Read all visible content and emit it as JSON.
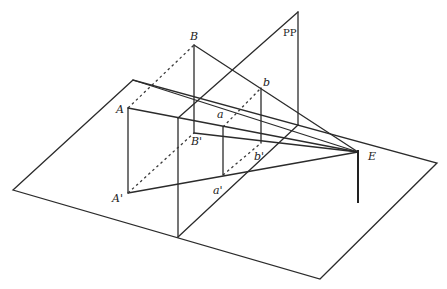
{
  "diagram": {
    "labels": {
      "B": "B",
      "PP": "PP",
      "A": "A",
      "a": "a",
      "b": "b",
      "B_prime": "B'",
      "E": "E",
      "b_prime": "b'",
      "A_prime": "A'",
      "a_prime": "a'"
    },
    "colors": {
      "line": "#2b2b2b",
      "background": "#ffffff"
    }
  }
}
